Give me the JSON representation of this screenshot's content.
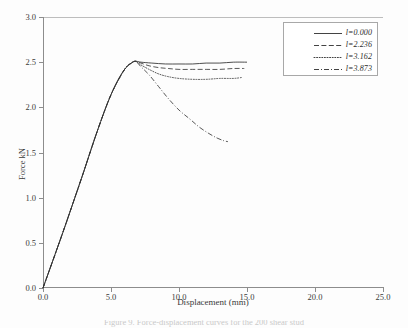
{
  "figure": {
    "background": "#fdfdfd",
    "line_color": "#2e2e2e",
    "axis_color": "#8d8d8d",
    "caption_partial": "Figure 9. Force-displacement curves for the 200 shear stud"
  },
  "chart_data": {
    "type": "line",
    "title": "",
    "xlabel": "Displacement (mm)",
    "ylabel": "Force kN",
    "xlim": [
      0.0,
      25.0
    ],
    "ylim": [
      0.0,
      3.0
    ],
    "xticks": [
      "0.0",
      "5.0",
      "10.0",
      "15.0",
      "20.0",
      "25.0"
    ],
    "xtick_values": [
      0.0,
      5.0,
      10.0,
      15.0,
      20.0,
      25.0
    ],
    "yticks": [
      "0.0",
      "0.5",
      "1.0",
      "1.5",
      "2.0",
      "2.5",
      "3.0"
    ],
    "ytick_values": [
      0.0,
      0.5,
      1.0,
      1.5,
      2.0,
      2.5,
      3.0
    ],
    "grid": false,
    "legend_position": "upper right",
    "series": [
      {
        "name": "l=0.000",
        "style": "solid",
        "x": [
          0.0,
          0.5,
          1.0,
          1.5,
          2.0,
          2.5,
          3.0,
          3.5,
          4.0,
          4.5,
          5.0,
          5.5,
          6.0,
          6.5,
          6.8,
          7.2,
          8.0,
          9.0,
          10.0,
          11.0,
          12.0,
          13.0,
          14.0,
          15.0
        ],
        "y": [
          0.0,
          0.21,
          0.42,
          0.63,
          0.85,
          1.07,
          1.29,
          1.52,
          1.74,
          1.95,
          2.14,
          2.3,
          2.42,
          2.49,
          2.51,
          2.5,
          2.49,
          2.48,
          2.48,
          2.48,
          2.49,
          2.49,
          2.5,
          2.5
        ]
      },
      {
        "name": "l=2.236",
        "style": "dashed",
        "x": [
          0.0,
          1.0,
          2.0,
          3.0,
          4.0,
          5.0,
          6.0,
          6.5,
          6.8,
          7.2,
          7.8,
          8.5,
          9.2,
          10.0,
          11.0,
          12.0,
          13.0,
          14.0,
          14.8
        ],
        "y": [
          0.0,
          0.42,
          0.85,
          1.29,
          1.74,
          2.14,
          2.42,
          2.49,
          2.51,
          2.49,
          2.46,
          2.44,
          2.43,
          2.42,
          2.42,
          2.42,
          2.42,
          2.43,
          2.43
        ]
      },
      {
        "name": "l=3.162",
        "style": "dotted",
        "x": [
          0.0,
          1.0,
          2.0,
          3.0,
          4.0,
          5.0,
          6.0,
          6.5,
          6.8,
          7.2,
          7.8,
          8.5,
          9.2,
          10.0,
          11.0,
          12.0,
          13.0,
          14.0,
          14.6
        ],
        "y": [
          0.0,
          0.42,
          0.85,
          1.29,
          1.74,
          2.14,
          2.42,
          2.49,
          2.51,
          2.47,
          2.42,
          2.37,
          2.34,
          2.32,
          2.31,
          2.31,
          2.32,
          2.32,
          2.33
        ]
      },
      {
        "name": "l=3.873",
        "style": "dashdot",
        "x": [
          0.0,
          1.0,
          2.0,
          3.0,
          4.0,
          5.0,
          6.0,
          6.5,
          6.8,
          7.2,
          7.8,
          8.5,
          9.2,
          10.0,
          10.8,
          11.5,
          12.2,
          12.8,
          13.3,
          13.6
        ],
        "y": [
          0.0,
          0.42,
          0.85,
          1.29,
          1.74,
          2.14,
          2.42,
          2.49,
          2.51,
          2.45,
          2.36,
          2.23,
          2.1,
          1.97,
          1.87,
          1.78,
          1.71,
          1.66,
          1.63,
          1.62
        ]
      }
    ]
  },
  "legend": {
    "entries": [
      {
        "label": "l=0.000",
        "style": "solid"
      },
      {
        "label": "l=2.236",
        "style": "dashed"
      },
      {
        "label": "l=3.162",
        "style": "dotted"
      },
      {
        "label": "l=3.873",
        "style": "dashdot"
      }
    ]
  }
}
